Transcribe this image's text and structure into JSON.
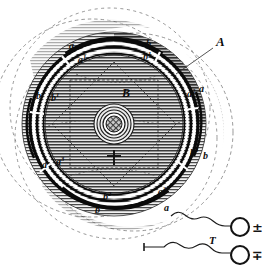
{
  "figure": {
    "kind": "antique-engraving-diagram",
    "title": "",
    "background_color": "#ffffff",
    "ink_color": "#111111",
    "hatch_color": "#3a3a3a",
    "plate_tone": "#d8d8d8",
    "dark_band_color": "#8a8a8a"
  },
  "labels": {
    "outer_ring": "A",
    "inner_disc": "B",
    "lead_line_target": "A",
    "coil_label": "T",
    "terminal_top": "±",
    "terminal_bottom": "∓",
    "ring_marks": [
      {
        "id": "a-top-left",
        "base": "a",
        "sup": "",
        "x": 69,
        "y": 49
      },
      {
        "id": "a1-top-left",
        "base": "a",
        "sup": "1",
        "x": 78,
        "y": 63
      },
      {
        "id": "b-top-right",
        "base": "b",
        "sup": "",
        "x": 146,
        "y": 47
      },
      {
        "id": "b1-top-right",
        "base": "b",
        "sup": "1",
        "x": 143,
        "y": 60
      },
      {
        "id": "b-left",
        "base": "b",
        "sup": "",
        "x": 36,
        "y": 99
      },
      {
        "id": "b1-left",
        "base": "b",
        "sup": "1",
        "x": 51,
        "y": 101
      },
      {
        "id": "a2-right",
        "base": "a",
        "sup": "2",
        "x": 187,
        "y": 97
      },
      {
        "id": "a-right",
        "base": "a",
        "sup": "",
        "x": 199,
        "y": 92
      },
      {
        "id": "a-lower-left",
        "base": "a",
        "sup": "",
        "x": 42,
        "y": 168
      },
      {
        "id": "a3-lower-left",
        "base": "a",
        "sup": "3",
        "x": 56,
        "y": 165
      },
      {
        "id": "b3-lower-right",
        "base": "b",
        "sup": "3",
        "x": 190,
        "y": 156
      },
      {
        "id": "b-lower-right",
        "base": "b",
        "sup": "",
        "x": 203,
        "y": 159
      },
      {
        "id": "b2-bottom",
        "base": "b",
        "sup": "2",
        "x": 103,
        "y": 200
      },
      {
        "id": "b-bottom",
        "base": "b",
        "sup": "",
        "x": 95,
        "y": 213
      },
      {
        "id": "a3-bottom",
        "base": "a",
        "sup": "3",
        "x": 158,
        "y": 195
      },
      {
        "id": "a-bottom",
        "base": "a",
        "sup": "",
        "x": 164,
        "y": 211
      }
    ]
  },
  "geometry": {
    "center_x": 114,
    "center_y": 124,
    "outer_dashed_radius": 104,
    "plate_radius": 92,
    "ring_outer_radius": 84,
    "ring_inner_radius": 71,
    "disc_radius": 69,
    "core_radii": [
      20,
      17,
      14,
      11,
      8
    ],
    "star_points": 8,
    "star_radius": 62,
    "ghost_circle_offsets": [
      {
        "dx": -22,
        "dy": -6,
        "r": 99
      },
      {
        "dx": 20,
        "dy": 8,
        "r": 99
      },
      {
        "dx": 2,
        "dy": 14,
        "r": 101
      },
      {
        "dx": -4,
        "dy": -16,
        "r": 100
      }
    ]
  },
  "terminals": {
    "top": {
      "cx": 240,
      "cy": 227,
      "r": 9,
      "sign": "±"
    },
    "bottom": {
      "cx": 240,
      "cy": 255,
      "r": 9,
      "sign": "∓"
    }
  }
}
